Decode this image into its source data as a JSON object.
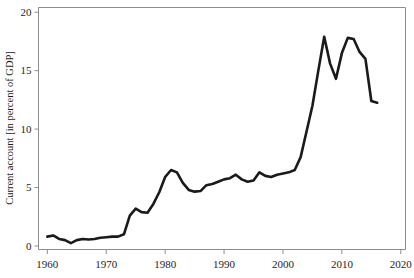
{
  "chart_data": {
    "type": "line",
    "title": "",
    "subtitle": "",
    "xlabel": "",
    "ylabel": "Current account [in percent of GDP]",
    "xlim": [
      1958.5,
      2020.8
    ],
    "ylim": [
      -0.3,
      20.4
    ],
    "grid": false,
    "legend": null,
    "x_ticks": [
      1960,
      1970,
      1980,
      1990,
      2000,
      2010,
      2020
    ],
    "x_tick_labels": [
      "1960",
      "1970",
      "1980",
      "1990",
      "2000",
      "2010",
      "2020"
    ],
    "y_ticks": [
      0,
      5,
      10,
      15,
      20
    ],
    "y_tick_labels": [
      "0",
      "5",
      "10",
      "15",
      "20"
    ],
    "series": [
      {
        "name": "Current account (percent of GDP)",
        "color": "#1a1a1a",
        "x": [
          1960,
          1961,
          1962,
          1963,
          1964,
          1965,
          1966,
          1967,
          1968,
          1969,
          1970,
          1971,
          1972,
          1973,
          1974,
          1975,
          1976,
          1977,
          1978,
          1979,
          1980,
          1981,
          1982,
          1983,
          1984,
          1985,
          1986,
          1987,
          1988,
          1989,
          1990,
          1991,
          1992,
          1993,
          1994,
          1995,
          1996,
          1997,
          1998,
          1999,
          2000,
          2001,
          2002,
          2003,
          2004,
          2005,
          2006,
          2007,
          2008,
          2009,
          2010,
          2011,
          2012,
          2013,
          2014,
          2015,
          2016
        ],
        "values": [
          0.8,
          0.9,
          0.6,
          0.5,
          0.25,
          0.5,
          0.6,
          0.55,
          0.6,
          0.7,
          0.75,
          0.8,
          0.8,
          1.0,
          2.6,
          3.2,
          2.9,
          2.85,
          3.6,
          4.6,
          5.9,
          6.5,
          6.3,
          5.4,
          4.8,
          4.65,
          4.7,
          5.2,
          5.3,
          5.5,
          5.7,
          5.8,
          6.1,
          5.7,
          5.5,
          5.6,
          6.3,
          6.0,
          5.9,
          6.1,
          6.2,
          6.3,
          6.5,
          7.6,
          9.8,
          12.0,
          15.0,
          17.9,
          15.6,
          14.3,
          16.5,
          17.8,
          17.7,
          16.6,
          16.0,
          12.4,
          12.25
        ]
      }
    ]
  },
  "axes": {
    "y_axis_label": "Current account [in percent of GDP]"
  }
}
